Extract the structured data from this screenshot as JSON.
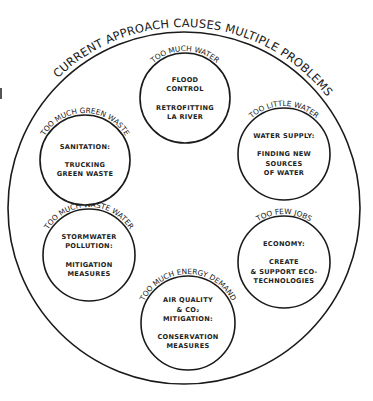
{
  "diagram": {
    "title": "CURRENT APPROACH CAUSES MULTIPLE PROBLEMS",
    "outer_circle": {
      "cx": 184,
      "cy": 208,
      "r": 176
    },
    "colors": {
      "stroke": "#1a1a1a",
      "text": "#222222",
      "background": "#ffffff"
    },
    "nodes": [
      {
        "id": "flood",
        "problem": "TOO MUCH WATER",
        "lines": [
          "FLOOD",
          "CONTROL",
          "",
          "RETROFITTING",
          "LA RIVER"
        ],
        "cx": 185,
        "cy": 98,
        "r": 45
      },
      {
        "id": "water-supply",
        "problem": "TOO LITTLE WATER",
        "lines": [
          "WATER SUPPLY:",
          "",
          "FINDING NEW",
          "SOURCES",
          "OF WATER"
        ],
        "cx": 284,
        "cy": 154,
        "r": 46
      },
      {
        "id": "economy",
        "problem": "TOO FEW JOBS",
        "lines": [
          "ECONOMY:",
          "",
          "CREATE",
          "& SUPPORT ECO-",
          "TECHNOLOGIES"
        ],
        "cx": 284,
        "cy": 262,
        "r": 46
      },
      {
        "id": "air-quality",
        "problem": "TOO MUCH ENERGY DEMAND",
        "lines": [
          "AIR QUALITY",
          "& CO₂",
          "MITIGATION:",
          "",
          "CONSERVATION",
          "MEASURES"
        ],
        "cx": 188,
        "cy": 323,
        "r": 47
      },
      {
        "id": "stormwater",
        "problem": "TOO MUCH WASTE WATER",
        "lines": [
          "STORMWATER",
          "POLLUTION:",
          "",
          "MITIGATION",
          "MEASURES"
        ],
        "cx": 89,
        "cy": 255,
        "r": 46
      },
      {
        "id": "sanitation",
        "problem": "TOO MUCH GREEN WASTE",
        "lines": [
          "SANITATION:",
          "",
          "TRUCKING",
          "GREEN WASTE"
        ],
        "cx": 85,
        "cy": 160,
        "r": 45
      }
    ]
  }
}
